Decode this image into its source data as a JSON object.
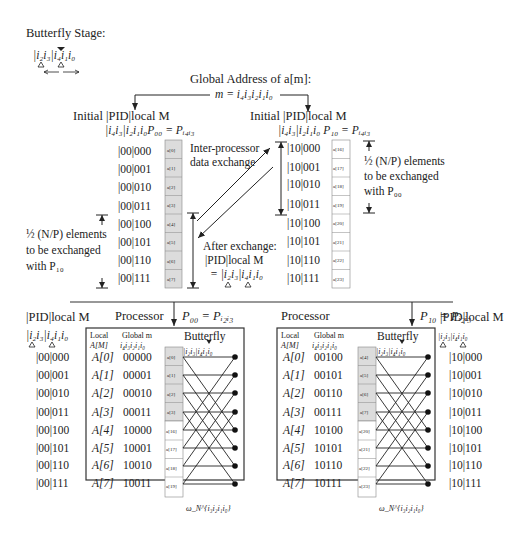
{
  "butterfly_stage": {
    "title": "Butterfly Stage:",
    "index_expr": "|i₂i₃|i₄i₁i₀"
  },
  "global_address": {
    "title": "Global Address of a[m]:",
    "expr": "m = i₄i₃i₂i₁i₀"
  },
  "top_left": {
    "heading": "Initial  |PID|local M",
    "subheading": "|i₄i₃|i₂i₁i₀P₀₀ = Pᵢ₄ᵢ₃",
    "addresses": [
      "|00|000",
      "|00|001",
      "|00|010",
      "|00|011",
      "|00|100",
      "|00|101",
      "|00|110",
      "|00|111"
    ],
    "cells": [
      "a[0]",
      "a[1]",
      "a[2]",
      "a[3]",
      "a[4]",
      "a[5]",
      "a[6]",
      "a[7]"
    ],
    "note_line1": "½ (N/P) elements",
    "note_line2": "to be exchanged",
    "note_line3": "with P₁₀"
  },
  "top_right": {
    "heading": "Initial  |PID|local M",
    "subheading": "|i₄i₃|i₂i₁i₀ P₁₀ = Pᵢ₄ᵢ₃",
    "addresses": [
      "|10|000",
      "|10|001",
      "|10|010",
      "|10|011",
      "|10|100",
      "|10|101",
      "|10|110",
      "|10|111"
    ],
    "cells": [
      "a[16]",
      "a[17]",
      "a[18]",
      "a[19]",
      "a[20]",
      "a[21]",
      "a[22]",
      "a[23]"
    ],
    "note_line1": "½ (N/P) elements",
    "note_line2": "to be exchanged",
    "note_line3": "with P₀₀"
  },
  "exchange": {
    "label_line1": "Inter-processor",
    "label_line2": "data exchange",
    "after_line1": "After exchange:",
    "after_line2": "|PID|local  M",
    "after_line3": "= |i₂i₃|i₄i₁i₀"
  },
  "bottom_left": {
    "side_heading": "|PID|local  M",
    "side_sub": "|i₂i₃|i₄i₁i₀",
    "processor_label": "Processor",
    "processor_eq": "P₀₀ = Pᵢ₂ᵢ₃",
    "col_local": "Local",
    "col_local2": "A[M]",
    "col_global": "Global m",
    "col_global2": "i₄i₃i₂i₁i₀",
    "col_butterfly": "Butterfly",
    "butterfly_index": "|i₂i₃|i₄i₁i₀",
    "addresses": [
      "|00|000",
      "|00|001",
      "|00|010",
      "|00|011",
      "|00|100",
      "|00|101",
      "|00|110",
      "|00|111"
    ],
    "locals": [
      "A[0]",
      "A[1]",
      "A[2]",
      "A[3]",
      "A[4]",
      "A[5]",
      "A[6]",
      "A[7]"
    ],
    "globals": [
      "00000",
      "00001",
      "00010",
      "00011",
      "10000",
      "10001",
      "10010",
      "10011"
    ],
    "cells": [
      "a[0]",
      "a[1]",
      "a[2]",
      "a[3]",
      "a[16]",
      "a[17]",
      "a[18]",
      "a[19]"
    ],
    "twiddle": "ω_N^{i₃i₂i₁i₀}"
  },
  "bottom_right": {
    "side_heading": "|PID|local M",
    "side_sub": "|i₂i₃|i₄i₁i₀",
    "processor_label": "Processor",
    "processor_eq": "P₁₀ = Pᵢ₂ᵢ₃",
    "col_local": "Local",
    "col_local2": "A[M]",
    "col_global": "Global m",
    "col_global2": "i₄i₃i₂i₁i₀",
    "col_butterfly": "Butterfly",
    "butterfly_index": "|i₂i₃|i₄i₁i₀",
    "addresses": [
      "|10|000",
      "|10|001",
      "|10|010",
      "|10|011",
      "|10|100",
      "|10|101",
      "|10|110",
      "|10|111"
    ],
    "locals": [
      "A[0]",
      "A[1]",
      "A[2]",
      "A[3]",
      "A[4]",
      "A[5]",
      "A[6]",
      "A[7]"
    ],
    "globals": [
      "00100",
      "00101",
      "00110",
      "00111",
      "10100",
      "10101",
      "10110",
      "10111"
    ],
    "cells": [
      "a[4]",
      "a[5]",
      "a[6]",
      "a[7]",
      "a[20]",
      "a[21]",
      "a[22]",
      "a[23]"
    ],
    "twiddle": "ω_N^{i₃i₂i₁i₀}"
  },
  "colors": {
    "shaded_cell": "#dcdcdc",
    "plain_cell": "#ffffff",
    "line": "#333333",
    "dot": "#111111"
  }
}
